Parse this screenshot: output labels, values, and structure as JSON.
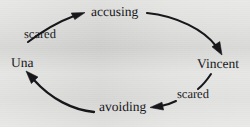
{
  "figure": {
    "title": "",
    "type": "cycle-diagram",
    "background_color": "#d9d9d7",
    "ink_color": "#16161a"
  },
  "nodes": [
    {
      "id": "accusing",
      "label": "accusing",
      "position": "top"
    },
    {
      "id": "vincent",
      "label": "Vincent",
      "position": "right"
    },
    {
      "id": "avoiding",
      "label": "avoiding",
      "position": "bottom"
    },
    {
      "id": "una",
      "label": "Una",
      "position": "left"
    }
  ],
  "edges": [
    {
      "id": "accusing-to-vincent",
      "from": "accusing",
      "to": "vincent",
      "label": "",
      "arrowhead": "end"
    },
    {
      "id": "vincent-to-avoiding",
      "from": "vincent",
      "to": "avoiding",
      "label": "scared",
      "arrowhead": "end"
    },
    {
      "id": "avoiding-to-una",
      "from": "avoiding",
      "to": "una",
      "label": "",
      "arrowhead": "end"
    },
    {
      "id": "una-to-accusing",
      "from": "una",
      "to": "accusing",
      "label": "scared",
      "arrowhead": "end"
    }
  ],
  "edge_labels": {
    "left": "scared",
    "right": "scared"
  }
}
